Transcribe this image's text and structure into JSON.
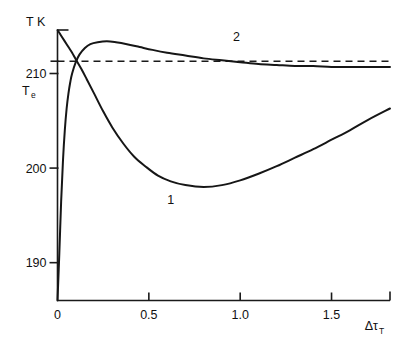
{
  "chart_data": {
    "type": "line",
    "title": "",
    "xlabel": "Δτ",
    "xlabel_sub": "T",
    "ylabel": "T K",
    "xlim": [
      0,
      1.82
    ],
    "ylim": [
      186.0,
      214.6
    ],
    "grid": false,
    "legend": "inline-curve-labels",
    "x_ticks": [
      "0",
      "0.5",
      "1.0",
      "1.5"
    ],
    "x_tick_values": [
      0,
      0.5,
      1.0,
      1.5
    ],
    "y_ticks": [
      "210",
      "200",
      "190"
    ],
    "y_tick_values": [
      210,
      200,
      190
    ],
    "annotations": [
      {
        "name": "equilibrium-temperature",
        "text": "T",
        "sub": "e",
        "value": 211.3
      },
      {
        "name": "curve-1-label",
        "text": "1",
        "x": 0.62,
        "y": 197.6
      },
      {
        "name": "curve-2-label",
        "text": "2",
        "x": 0.98,
        "y": 212.9
      }
    ],
    "asymptote": {
      "name": "Te-asymptote",
      "value": 211.3,
      "style": "dashed"
    },
    "series": [
      {
        "name": "1",
        "label": "1",
        "description": "monotone decreasing overshoot below Te then relaxation upward",
        "x": [
          0.0,
          0.02,
          0.04,
          0.06,
          0.08,
          0.1,
          0.13,
          0.16,
          0.2,
          0.25,
          0.3,
          0.36,
          0.42,
          0.48,
          0.55,
          0.62,
          0.7,
          0.8,
          0.9,
          1.0,
          1.1,
          1.2,
          1.3,
          1.4,
          1.5,
          1.6,
          1.7,
          1.82
        ],
        "y": [
          214.6,
          214.0,
          213.4,
          212.8,
          212.2,
          211.5,
          210.5,
          209.4,
          207.9,
          206.0,
          204.3,
          202.6,
          201.2,
          200.2,
          199.2,
          198.6,
          198.2,
          198.0,
          198.2,
          198.7,
          199.4,
          200.2,
          201.1,
          202.0,
          203.0,
          204.0,
          205.1,
          206.3
        ]
      },
      {
        "name": "2",
        "label": "2",
        "description": "rises steeply from origin, overshoots above Te, relaxes down toward Te",
        "x": [
          0.0,
          0.01,
          0.02,
          0.03,
          0.04,
          0.05,
          0.06,
          0.07,
          0.08,
          0.1,
          0.12,
          0.15,
          0.18,
          0.22,
          0.27,
          0.32,
          0.38,
          0.45,
          0.52,
          0.6,
          0.7,
          0.8,
          0.9,
          1.0,
          1.1,
          1.2,
          1.3,
          1.4,
          1.5,
          1.6,
          1.7,
          1.82
        ],
        "y": [
          186.0,
          191.0,
          196.5,
          200.8,
          204.0,
          206.3,
          207.9,
          209.1,
          210.0,
          211.2,
          212.0,
          212.7,
          213.1,
          213.3,
          213.4,
          213.3,
          213.1,
          212.8,
          212.5,
          212.2,
          211.9,
          211.6,
          211.4,
          211.2,
          211.0,
          210.9,
          210.8,
          210.8,
          210.7,
          210.7,
          210.7,
          210.7
        ]
      }
    ]
  }
}
